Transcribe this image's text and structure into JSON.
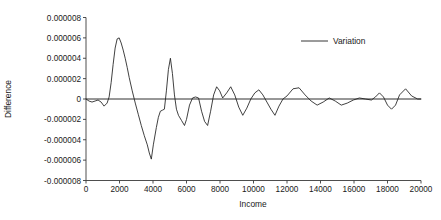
{
  "chart_data": {
    "type": "line",
    "title": "",
    "xlabel": "Income",
    "ylabel": "Difference",
    "xlim": [
      0,
      20000
    ],
    "ylim": [
      -8e-06,
      8e-06
    ],
    "grid": false,
    "legend_position": "top-right",
    "xticks": [
      0,
      2000,
      4000,
      6000,
      8000,
      10000,
      12000,
      14000,
      16000,
      18000,
      20000
    ],
    "xtick_labels": [
      "0",
      "2000",
      "4000",
      "6000",
      "8000",
      "10000",
      "12000",
      "14000",
      "16000",
      "18000",
      "20000"
    ],
    "yticks": [
      8e-06,
      6e-06,
      4e-06,
      2e-06,
      0,
      -2e-06,
      -4e-06,
      -6e-06,
      -8e-06
    ],
    "ytick_labels": [
      "0.000008",
      "0.000006",
      "0.000004",
      "0.000002",
      "0",
      "-0.000002",
      "-0.000004",
      "-0.000006",
      "-0.000008"
    ],
    "series": [
      {
        "name": "Variation",
        "color": "#1f1f1f",
        "x": [
          0,
          180,
          360,
          540,
          720,
          900,
          1080,
          1260,
          1380,
          1500,
          1620,
          1740,
          1860,
          1980,
          2100,
          2220,
          2340,
          2460,
          2580,
          2760,
          2940,
          3120,
          3300,
          3480,
          3660,
          3780,
          3900,
          4020,
          4200,
          4320,
          4440,
          4560,
          4680,
          4800,
          4920,
          5040,
          5160,
          5280,
          5400,
          5520,
          5700,
          5880,
          6000,
          6180,
          6360,
          6540,
          6720,
          6900,
          7080,
          7260,
          7440,
          7620,
          7800,
          7980,
          8160,
          8400,
          8640,
          8880,
          9120,
          9360,
          9600,
          9840,
          10080,
          10320,
          10560,
          10800,
          11040,
          11280,
          11520,
          11760,
          12000,
          12360,
          12720,
          13080,
          13440,
          13800,
          14160,
          14520,
          14880,
          15240,
          15600,
          15960,
          16320,
          16680,
          17040,
          17280,
          17520,
          17760,
          18000,
          18240,
          18480,
          18720,
          19080,
          19440,
          19800,
          20000
        ],
        "y": [
          0.0,
          -2e-07,
          -3e-07,
          -2e-07,
          -1e-07,
          -3e-07,
          -7e-07,
          -4e-07,
          2e-07,
          1.6e-06,
          3.4e-06,
          5e-06,
          5.9e-06,
          6e-06,
          5.5e-06,
          4.8e-06,
          4e-06,
          3.1e-06,
          2.1e-06,
          8e-07,
          -4e-07,
          -1.5e-06,
          -2.6e-06,
          -3.6e-06,
          -4.5e-06,
          -5.3e-06,
          -5.9e-06,
          -4.5e-06,
          -2.8e-06,
          -1.8e-06,
          -1.2e-06,
          -1.1e-06,
          -1e-06,
          8e-07,
          2.9e-06,
          4e-06,
          2.5e-06,
          4e-07,
          -1e-06,
          -1.6e-06,
          -2.1e-06,
          -2.6e-06,
          -2e-06,
          -6e-07,
          1e-07,
          2e-07,
          1e-07,
          -1.2e-06,
          -2.2e-06,
          -2.6e-06,
          -1.2e-06,
          4e-07,
          1.2e-06,
          8e-07,
          1e-07,
          6e-07,
          1.2e-06,
          4e-07,
          -8e-07,
          -1.6e-06,
          -9e-07,
          0.0,
          6e-07,
          9e-07,
          4e-07,
          -3e-07,
          -1e-06,
          -1.6e-06,
          -7e-07,
          0.0,
          3e-07,
          1e-06,
          1.1e-06,
          4e-07,
          -2e-07,
          -6e-07,
          -3e-07,
          1e-07,
          -2e-07,
          -6e-07,
          -4e-07,
          -1e-07,
          1e-07,
          0.0,
          -1e-07,
          2e-07,
          6e-07,
          2e-07,
          -6e-07,
          -1e-06,
          -6e-07,
          4e-07,
          1e-06,
          3e-07,
          0.0,
          0.0
        ]
      }
    ],
    "legend": [
      {
        "label": "Variation",
        "color": "#1f1f1f"
      }
    ]
  },
  "legend": {
    "variation_label": "Variation"
  },
  "axes": {
    "x_title": "Income",
    "y_title": "Difference"
  }
}
